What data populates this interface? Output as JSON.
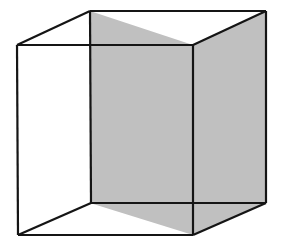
{
  "figure": {
    "name": "Necker cube wireframe with two shaded faces",
    "width": 281,
    "height": 249,
    "background_color": "#ffffff",
    "edge_color": "#151515",
    "edge_width": 2.2,
    "shaded_face_color": "#c0c0c0",
    "unshaded_face_color": "#ffffff",
    "alt_text": "Line drawing of a transparent cube seen in three-quarter view. The square face nearest the viewer and the right-hand side face are filled with light gray; the remaining faces are white, so all twelve edges are visible."
  },
  "geometry": {
    "description": "Two congruent squares, the far square offset up and to the right of the near square, joined corner to corner by four connecting edges.",
    "near_square": {
      "name": "front-face",
      "top_left": [
        17,
        45
      ],
      "top_right": [
        193,
        45
      ],
      "bottom_right": [
        193,
        235
      ],
      "bottom_left": [
        18,
        235
      ]
    },
    "far_square": {
      "name": "back-face",
      "top_left": [
        90,
        11
      ],
      "top_right": [
        266,
        11
      ],
      "bottom_right": [
        266,
        203
      ],
      "bottom_left": [
        91,
        203
      ]
    },
    "offset_vector": [
      73,
      -34
    ],
    "shaded_faces": [
      {
        "name": "center-square-face",
        "points": [
          [
            90,
            11
          ],
          [
            193,
            45
          ],
          [
            193,
            235
          ],
          [
            90,
            203
          ]
        ],
        "fill": "#c0c0c0"
      },
      {
        "name": "right-side-face",
        "points": [
          [
            193,
            45
          ],
          [
            266,
            11
          ],
          [
            266,
            203
          ],
          [
            193,
            235
          ]
        ],
        "fill": "#c0c0c0"
      }
    ],
    "edges": [
      {
        "name": "near-top-edge",
        "from": [
          17,
          45
        ],
        "to": [
          193,
          45
        ]
      },
      {
        "name": "near-right-edge",
        "from": [
          193,
          45
        ],
        "to": [
          193,
          235
        ]
      },
      {
        "name": "near-bottom-edge",
        "from": [
          193,
          235
        ],
        "to": [
          18,
          235
        ]
      },
      {
        "name": "near-left-edge",
        "from": [
          18,
          235
        ],
        "to": [
          17,
          45
        ]
      },
      {
        "name": "far-top-edge",
        "from": [
          90,
          11
        ],
        "to": [
          266,
          11
        ]
      },
      {
        "name": "far-right-edge",
        "from": [
          266,
          11
        ],
        "to": [
          266,
          203
        ]
      },
      {
        "name": "far-bottom-edge",
        "from": [
          266,
          203
        ],
        "to": [
          91,
          203
        ]
      },
      {
        "name": "far-left-edge",
        "from": [
          91,
          203
        ],
        "to": [
          90,
          11
        ]
      },
      {
        "name": "connector-top-left",
        "from": [
          17,
          45
        ],
        "to": [
          90,
          11
        ]
      },
      {
        "name": "connector-top-right",
        "from": [
          193,
          45
        ],
        "to": [
          266,
          11
        ]
      },
      {
        "name": "connector-bottom-right",
        "from": [
          193,
          235
        ],
        "to": [
          266,
          203
        ]
      },
      {
        "name": "connector-bottom-left",
        "from": [
          18,
          235
        ],
        "to": [
          91,
          203
        ]
      }
    ]
  }
}
